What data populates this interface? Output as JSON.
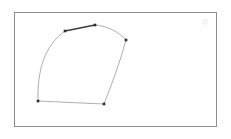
{
  "page": {
    "background_color": "#fefefe",
    "width": 231,
    "height": 139
  },
  "frame": {
    "name": "canvas-frame",
    "x": 14,
    "y": 12,
    "width": 203,
    "height": 115,
    "border_color": "#8e8e8e",
    "fill_color": "#ffffff"
  },
  "figure": {
    "title": "",
    "description": "Closed five-vertex curvilinear polygon outline",
    "stroke_color": "#9a9a9a",
    "bold_stroke_color": "#3c3c3c",
    "vertex_color": "#2a2a2a",
    "vertex_size": 2.6,
    "vertices": [
      {
        "id": "v-top-left",
        "label": "A",
        "x": 65,
        "y": 31
      },
      {
        "id": "v-top-apex",
        "label": "B",
        "x": 95,
        "y": 25
      },
      {
        "id": "v-right",
        "label": "C",
        "x": 126,
        "y": 40
      },
      {
        "id": "v-bottom-right",
        "label": "D",
        "x": 104,
        "y": 104
      },
      {
        "id": "v-bottom-left",
        "label": "E",
        "x": 38,
        "y": 101
      }
    ],
    "edges": [
      {
        "id": "edge-top-left-to-apex",
        "from": "v-top-left",
        "to": "v-top-apex",
        "style": "bold-straight",
        "path": "M 65 31 L 95 25"
      },
      {
        "id": "edge-apex-to-right",
        "from": "v-top-apex",
        "to": "v-right",
        "style": "curve",
        "path": "M 95 25 C 108 26 119 32 126 40"
      },
      {
        "id": "edge-right-to-bottom-right",
        "from": "v-right",
        "to": "v-bottom-right",
        "style": "near-straight",
        "path": "M 126 40 C 120 62 112 84 104 104"
      },
      {
        "id": "edge-bottom",
        "from": "v-bottom-right",
        "to": "v-bottom-left",
        "style": "near-straight",
        "path": "M 104 104 C 82 103 60 102 38 101"
      },
      {
        "id": "edge-bottom-left-to-top-left",
        "from": "v-bottom-left",
        "to": "v-top-left",
        "style": "strong-curve",
        "path": "M 38 101 C 37 70 45 45 65 31"
      }
    ]
  },
  "artifacts": [
    {
      "id": "faint-corner-mark",
      "name": "faint-mark",
      "x": 205,
      "y": 22,
      "radius": 2.2,
      "color": "#d8d8d8"
    }
  ]
}
